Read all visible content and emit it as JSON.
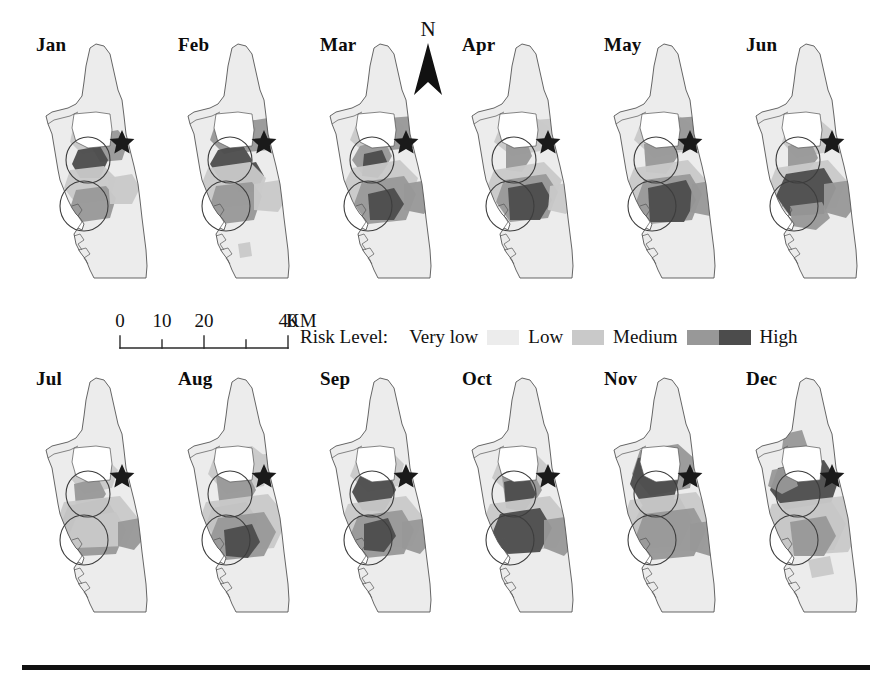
{
  "figure": {
    "title_present": false,
    "panel_count": 12,
    "rows": 2,
    "columns": 6
  },
  "north_arrow": {
    "label": "N",
    "icon": "north-arrow-icon"
  },
  "scalebar": {
    "ticks": [
      "0",
      "10",
      "20",
      "40"
    ],
    "tick_positions_px": [
      10,
      52,
      94,
      178
    ],
    "unit": "KM",
    "segments": 5,
    "unit_label_full": "40 KM"
  },
  "legend": {
    "title": "Risk Level:",
    "entries": [
      {
        "label": "Very low",
        "color": "#ececec",
        "order": 1
      },
      {
        "label": "Low",
        "color": "#c9c9c9",
        "order": 2
      },
      {
        "label": "Medium",
        "color": "#989898",
        "order": 3
      },
      {
        "label": "High",
        "color": "#4c4c4c",
        "order": 4
      }
    ]
  },
  "colors": {
    "background": "#ffffff",
    "outline": "#555555",
    "text": "#111111",
    "rule": "#111111",
    "very_low": "#ececec",
    "low": "#c9c9c9",
    "medium": "#989898",
    "high": "#4c4c4c",
    "star": "#1a1a1a",
    "circle_stroke": "#3d3d3d"
  },
  "panels": [
    {
      "month": "Jan",
      "row": 0,
      "col": 0,
      "x": 34,
      "y": 38,
      "risk_summary": {
        "very_low": 0.66,
        "low": 0.2,
        "medium": 0.09,
        "high": 0.05
      },
      "markers": {
        "star": true,
        "circles": 2
      },
      "patches": [
        {
          "level": "low",
          "d": "M 40 86 L 62 82 L 74 92 L 70 112 L 48 116 L 36 104 Z"
        },
        {
          "level": "medium",
          "d": "M 62 96 L 84 92 L 94 104 L 88 122 L 66 124 L 58 110 Z"
        },
        {
          "level": "high",
          "d": "M 44 112 L 66 108 L 74 122 L 66 140 L 46 140 L 38 126 Z"
        },
        {
          "level": "low",
          "d": "M 36 132 L 70 128 L 82 140 L 76 162 L 42 166 L 30 150 Z"
        },
        {
          "level": "medium",
          "d": "M 42 152 L 72 148 L 82 160 L 76 180 L 48 184 L 36 170 Z"
        },
        {
          "level": "low",
          "d": "M 74 140 L 98 136 L 106 150 L 98 166 L 76 166 Z"
        }
      ]
    },
    {
      "month": "Feb",
      "row": 0,
      "col": 1,
      "x": 176,
      "y": 38,
      "risk_summary": {
        "very_low": 0.58,
        "low": 0.22,
        "medium": 0.12,
        "high": 0.08
      },
      "markers": {
        "star": true,
        "circles": 2
      },
      "patches": [
        {
          "level": "medium",
          "d": "M 40 84 L 66 78 L 80 90 L 76 110 L 48 116 L 34 102 Z"
        },
        {
          "level": "medium",
          "d": "M 66 84 L 92 80 L 100 94 L 94 112 L 70 114 Z"
        },
        {
          "level": "high",
          "d": "M 42 112 L 66 106 L 76 122 L 66 142 L 44 142 L 34 126 Z"
        },
        {
          "level": "high",
          "d": "M 60 128 L 80 124 L 88 138 L 80 154 L 62 154 Z"
        },
        {
          "level": "low",
          "d": "M 32 130 L 74 124 L 90 140 L 82 166 L 40 170 L 24 150 Z"
        },
        {
          "level": "medium",
          "d": "M 40 148 L 76 144 L 86 158 L 78 182 L 46 186 L 34 168 Z"
        },
        {
          "level": "low",
          "d": "M 78 146 L 104 142 L 112 158 L 102 174 L 78 172 Z"
        },
        {
          "level": "low",
          "d": "M 62 206 L 74 204 L 76 218 L 64 220 Z"
        }
      ]
    },
    {
      "month": "Mar",
      "row": 0,
      "col": 2,
      "x": 318,
      "y": 38,
      "risk_summary": {
        "very_low": 0.55,
        "low": 0.23,
        "medium": 0.14,
        "high": 0.08
      },
      "markers": {
        "star": true,
        "circles": 2
      },
      "patches": [
        {
          "level": "low",
          "d": "M 40 82 L 70 76 L 86 88 L 82 110 L 50 118 L 32 102 Z"
        },
        {
          "level": "medium",
          "d": "M 70 80 L 96 78 L 104 92 L 96 110 L 72 112 Z"
        },
        {
          "level": "medium",
          "d": "M 42 108 L 66 102 L 74 118 L 64 136 L 44 136 L 34 122 Z"
        },
        {
          "level": "high",
          "d": "M 46 116 L 64 112 L 70 126 L 60 140 L 44 138 Z"
        },
        {
          "level": "low",
          "d": "M 34 130 L 82 122 L 100 140 L 90 168 L 42 172 L 24 150 Z"
        },
        {
          "level": "medium",
          "d": "M 44 144 L 86 138 L 98 156 L 88 182 L 50 186 L 36 166 Z"
        },
        {
          "level": "high",
          "d": "M 50 156 L 76 150 L 86 166 L 76 182 L 52 182 Z"
        },
        {
          "level": "medium",
          "d": "M 86 146 L 110 142 L 118 160 L 106 176 L 86 172 Z"
        }
      ]
    },
    {
      "month": "Apr",
      "row": 0,
      "col": 3,
      "x": 460,
      "y": 38,
      "risk_summary": {
        "very_low": 0.57,
        "low": 0.22,
        "medium": 0.13,
        "high": 0.08
      },
      "markers": {
        "star": true,
        "circles": 2
      },
      "patches": [
        {
          "level": "low",
          "d": "M 42 84 L 74 78 L 90 90 L 86 112 L 52 118 L 34 104 Z"
        },
        {
          "level": "low",
          "d": "M 74 82 L 100 80 L 108 94 L 100 110 L 76 112 Z"
        },
        {
          "level": "medium",
          "d": "M 46 106 L 66 102 L 72 118 L 62 134 L 46 132 Z"
        },
        {
          "level": "low",
          "d": "M 34 132 L 84 124 L 102 142 L 92 168 L 44 172 L 26 152 Z"
        },
        {
          "level": "medium",
          "d": "M 44 142 L 86 136 L 98 154 L 88 180 L 50 184 L 36 164 Z"
        },
        {
          "level": "high",
          "d": "M 48 150 L 82 144 L 92 162 L 80 182 L 50 182 Z"
        },
        {
          "level": "low",
          "d": "M 90 148 L 112 144 L 118 162 L 106 176 L 88 172 Z"
        }
      ]
    },
    {
      "month": "May",
      "row": 0,
      "col": 4,
      "x": 602,
      "y": 38,
      "risk_summary": {
        "very_low": 0.53,
        "low": 0.24,
        "medium": 0.14,
        "high": 0.09
      },
      "markers": {
        "star": true,
        "circles": 2
      },
      "patches": [
        {
          "level": "low",
          "d": "M 40 82 L 74 76 L 92 88 L 88 112 L 52 120 L 32 102 Z"
        },
        {
          "level": "medium",
          "d": "M 72 80 L 100 78 L 108 94 L 100 112 L 74 112 Z"
        },
        {
          "level": "medium",
          "d": "M 42 106 L 68 100 L 76 118 L 64 136 L 44 134 Z"
        },
        {
          "level": "low",
          "d": "M 32 130 L 86 122 L 104 142 L 94 170 L 42 174 L 24 150 Z"
        },
        {
          "level": "medium",
          "d": "M 42 142 L 88 136 L 100 156 L 90 182 L 48 186 L 34 164 Z"
        },
        {
          "level": "high",
          "d": "M 46 150 L 84 142 L 94 162 L 82 184 L 48 184 Z"
        },
        {
          "level": "medium",
          "d": "M 90 146 L 114 142 L 122 162 L 108 178 L 88 174 Z"
        }
      ]
    },
    {
      "month": "Jun",
      "row": 0,
      "col": 5,
      "x": 744,
      "y": 38,
      "risk_summary": {
        "very_low": 0.56,
        "low": 0.21,
        "medium": 0.13,
        "high": 0.1
      },
      "markers": {
        "star": true,
        "circles": 2
      },
      "patches": [
        {
          "level": "low",
          "d": "M 44 88 L 76 82 L 90 94 L 84 114 L 52 120 L 38 104 Z"
        },
        {
          "level": "medium",
          "d": "M 44 108 L 66 102 L 74 120 L 62 136 L 44 134 Z"
        },
        {
          "level": "low",
          "d": "M 32 130 L 84 122 L 102 142 L 92 170 L 42 174 L 24 150 Z"
        },
        {
          "level": "high",
          "d": "M 42 136 L 80 130 L 92 150 L 80 176 L 46 178 L 32 158 Z"
        },
        {
          "level": "medium",
          "d": "M 80 146 L 108 142 L 116 162 L 102 180 L 80 174 Z"
        },
        {
          "level": "medium",
          "d": "M 46 168 L 78 164 L 86 180 L 72 192 L 48 188 Z"
        }
      ]
    },
    {
      "month": "Jul",
      "row": 1,
      "col": 0,
      "x": 34,
      "y": 372,
      "risk_summary": {
        "very_low": 0.62,
        "low": 0.19,
        "medium": 0.11,
        "high": 0.08
      },
      "markers": {
        "star": true,
        "circles": 2
      },
      "patches": [
        {
          "level": "low",
          "d": "M 44 92 L 72 86 L 84 98 L 78 116 L 50 122 L 38 108 Z"
        },
        {
          "level": "medium",
          "d": "M 40 112 L 64 106 L 72 122 L 62 138 L 42 136 Z"
        },
        {
          "level": "high",
          "d": "M 34 134 L 72 126 L 84 146 L 72 170 L 40 172 L 26 154 Z"
        },
        {
          "level": "medium",
          "d": "M 42 146 L 82 140 L 92 158 L 82 182 L 48 184 L 34 166 Z"
        },
        {
          "level": "low",
          "d": "M 30 130 L 86 124 L 104 146 L 92 174 L 40 176 L 22 152 Z"
        },
        {
          "level": "medium",
          "d": "M 84 150 L 106 146 L 112 164 L 100 178 L 84 174 Z"
        }
      ]
    },
    {
      "month": "Aug",
      "row": 1,
      "col": 1,
      "x": 176,
      "y": 372,
      "risk_summary": {
        "very_low": 0.54,
        "low": 0.24,
        "medium": 0.14,
        "high": 0.08
      },
      "markers": {
        "star": true,
        "circles": 2
      },
      "patches": [
        {
          "level": "low",
          "d": "M 40 80 L 76 74 L 94 88 L 88 114 L 50 122 L 32 102 Z"
        },
        {
          "level": "low",
          "d": "M 76 84 L 102 80 L 110 96 L 100 112 L 78 112 Z"
        },
        {
          "level": "medium",
          "d": "M 40 104 L 70 98 L 80 118 L 68 138 L 44 136 Z"
        },
        {
          "level": "high",
          "d": "M 36 136 L 70 130 L 82 148 L 70 168 L 42 168 L 30 152 Z"
        },
        {
          "level": "low",
          "d": "M 30 130 L 92 122 L 112 146 L 98 176 L 42 180 L 22 152 Z"
        },
        {
          "level": "medium",
          "d": "M 42 146 L 88 140 L 100 160 L 88 184 L 50 188 L 34 166 Z"
        },
        {
          "level": "high",
          "d": "M 48 158 L 76 152 L 84 170 L 72 186 L 50 184 Z"
        }
      ]
    },
    {
      "month": "Sep",
      "row": 1,
      "col": 2,
      "x": 318,
      "y": 372,
      "risk_summary": {
        "very_low": 0.57,
        "low": 0.21,
        "medium": 0.13,
        "high": 0.09
      },
      "markers": {
        "star": true,
        "circles": 2
      },
      "patches": [
        {
          "level": "low",
          "d": "M 40 84 L 72 78 L 86 92 L 80 114 L 50 120 L 32 104 Z"
        },
        {
          "level": "high",
          "d": "M 42 104 L 70 98 L 78 118 L 66 140 L 44 138 L 34 120 Z"
        },
        {
          "level": "low",
          "d": "M 30 132 L 88 124 L 106 146 L 94 174 L 42 178 L 22 152 Z"
        },
        {
          "level": "medium",
          "d": "M 40 144 L 84 138 L 96 158 L 86 182 L 48 186 L 32 164 Z"
        },
        {
          "level": "high",
          "d": "M 46 152 L 70 146 L 78 164 L 66 180 L 46 178 Z"
        },
        {
          "level": "medium",
          "d": "M 84 150 L 110 146 L 116 166 L 102 182 L 84 176 Z"
        }
      ]
    },
    {
      "month": "Oct",
      "row": 1,
      "col": 3,
      "x": 460,
      "y": 372,
      "risk_summary": {
        "very_low": 0.55,
        "low": 0.22,
        "medium": 0.13,
        "high": 0.1
      },
      "markers": {
        "star": true,
        "circles": 2
      },
      "patches": [
        {
          "level": "low",
          "d": "M 40 86 L 74 80 L 88 94 L 82 116 L 50 122 L 32 106 Z"
        },
        {
          "level": "medium",
          "d": "M 42 104 L 72 98 L 82 118 L 70 138 L 46 136 Z"
        },
        {
          "level": "high",
          "d": "M 44 110 L 68 104 L 76 122 L 64 140 L 46 136 Z"
        },
        {
          "level": "low",
          "d": "M 30 132 L 90 124 L 110 148 L 96 176 L 42 180 L 22 152 Z"
        },
        {
          "level": "high",
          "d": "M 40 142 L 80 136 L 92 156 L 80 180 L 46 182 L 32 162 Z"
        },
        {
          "level": "medium",
          "d": "M 84 148 L 112 144 L 120 166 L 104 184 L 84 176 Z"
        }
      ]
    },
    {
      "month": "Nov",
      "row": 1,
      "col": 4,
      "x": 602,
      "y": 372,
      "risk_summary": {
        "very_low": 0.47,
        "low": 0.22,
        "medium": 0.16,
        "high": 0.15
      },
      "markers": {
        "star": true,
        "circles": 2
      },
      "patches": [
        {
          "level": "medium",
          "d": "M 38 78 L 76 72 L 94 88 L 88 116 L 48 124 L 30 102 Z"
        },
        {
          "level": "high",
          "d": "M 36 86 L 66 80 L 78 102 L 70 134 L 42 136 L 28 112 Z"
        },
        {
          "level": "high",
          "d": "M 40 134 L 78 126 L 90 148 L 78 174 L 44 176 L 30 154 Z"
        },
        {
          "level": "low",
          "d": "M 28 128 L 94 120 L 114 148 L 100 178 L 42 182 L 20 152 Z"
        },
        {
          "level": "medium",
          "d": "M 42 142 L 92 136 L 104 158 L 92 184 L 50 188 L 34 164 Z"
        },
        {
          "level": "medium",
          "d": "M 88 152 L 114 148 L 122 168 L 108 184 L 88 178 Z"
        }
      ]
    },
    {
      "month": "Dec",
      "row": 1,
      "col": 5,
      "x": 744,
      "y": 372,
      "risk_summary": {
        "very_low": 0.48,
        "low": 0.22,
        "medium": 0.16,
        "high": 0.14
      },
      "markers": {
        "star": true,
        "circles": 2
      },
      "patches": [
        {
          "level": "medium",
          "d": "M 40 62 L 58 58 L 64 76 L 50 84 L 38 76 Z"
        },
        {
          "level": "high",
          "d": "M 34 96 L 80 88 L 94 110 L 84 140 L 44 142 L 26 118 Z"
        },
        {
          "level": "medium",
          "d": "M 28 98 L 48 94 L 54 114 L 38 122 L 24 114 Z"
        },
        {
          "level": "medium",
          "d": "M 38 138 L 88 130 L 102 152 L 90 178 L 46 180 L 30 158 Z"
        },
        {
          "level": "low",
          "d": "M 28 132 L 100 124 L 120 150 L 104 180 L 42 184 L 20 154 Z"
        },
        {
          "level": "medium",
          "d": "M 46 150 L 82 144 L 92 164 L 80 184 L 50 184 Z"
        },
        {
          "level": "low",
          "d": "M 64 188 L 86 184 L 90 202 L 68 206 Z"
        }
      ]
    }
  ]
}
